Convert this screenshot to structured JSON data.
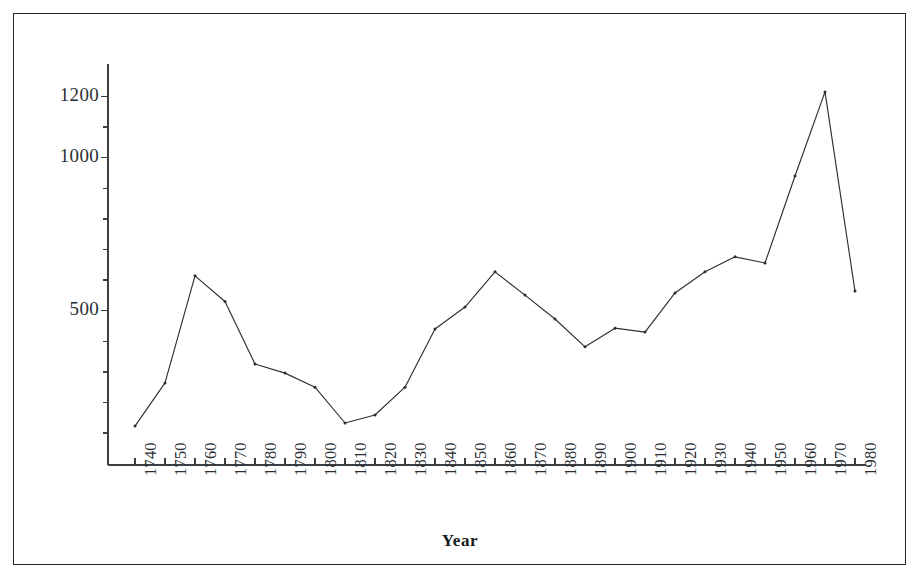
{
  "figure": {
    "frame_color": "#23282b",
    "background": "#ffffff"
  },
  "axis": {
    "line_color": "#3a3f44",
    "xlabel": "Year",
    "ylabel": "",
    "y_tick_labels": [
      "1200",
      "1000",
      "500"
    ],
    "y_tick_values": [
      1200,
      1000,
      500
    ],
    "y_minor_step": 100,
    "x_tick_labels": [
      "1740",
      "1750",
      "1760",
      "1770",
      "1780",
      "1790",
      "1800",
      "1810",
      "1820",
      "1830",
      "1840",
      "1850",
      "1860",
      "1870",
      "1880",
      "1890",
      "1900",
      "1910",
      "1920",
      "1930",
      "1940",
      "1950",
      "1960",
      "1970",
      "1980"
    ]
  },
  "chart_data": {
    "type": "line",
    "title": "",
    "subtitle": "",
    "xlabel": "Year",
    "ylabel": "",
    "grid": false,
    "legend": null,
    "marker": "dot",
    "line_color": "#2b3034",
    "xlim": [
      1740,
      1980
    ],
    "ylim": [
      100,
      1280
    ],
    "x": [
      1740,
      1750,
      1760,
      1770,
      1780,
      1790,
      1800,
      1810,
      1820,
      1830,
      1840,
      1850,
      1860,
      1870,
      1880,
      1890,
      1900,
      1910,
      1920,
      1930,
      1940,
      1950,
      1960,
      1970,
      1980
    ],
    "categories": [
      "1740",
      "1750",
      "1760",
      "1770",
      "1780",
      "1790",
      "1800",
      "1810",
      "1820",
      "1830",
      "1840",
      "1850",
      "1860",
      "1870",
      "1880",
      "1890",
      "1900",
      "1910",
      "1920",
      "1930",
      "1940",
      "1950",
      "1960",
      "1970",
      "1980"
    ],
    "values": [
      123,
      264,
      614,
      530,
      326,
      296,
      250,
      133,
      159,
      250,
      440,
      512,
      627,
      551,
      473,
      382,
      443,
      430,
      558,
      627,
      676,
      656,
      940,
      1215,
      564
    ],
    "series": [
      {
        "name": "series-1",
        "values": [
          123,
          264,
          614,
          530,
          326,
          296,
          250,
          133,
          159,
          250,
          440,
          512,
          627,
          551,
          473,
          382,
          443,
          430,
          558,
          627,
          676,
          656,
          940,
          1215,
          564
        ]
      }
    ]
  }
}
